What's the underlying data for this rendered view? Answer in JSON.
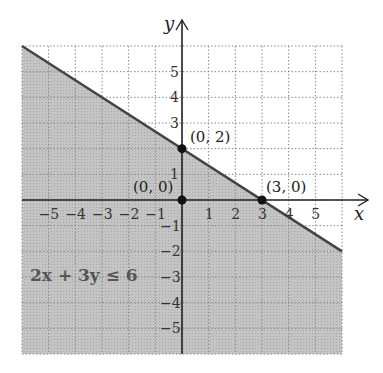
{
  "chart_data": {
    "type": "line",
    "title": "",
    "xlabel": "x",
    "ylabel": "y",
    "xlim": [
      -6,
      6
    ],
    "ylim": [
      -6,
      6
    ],
    "grid": true,
    "x_ticks": [
      -5,
      -4,
      -3,
      -2,
      -1,
      1,
      2,
      3,
      4,
      5
    ],
    "x_tick_labels": [
      "−5",
      "−4",
      "−3",
      "−2",
      "−1",
      "1",
      "2",
      "3",
      "4",
      "5"
    ],
    "y_ticks": [
      5,
      4,
      3,
      1,
      -1,
      -2,
      -3,
      -4,
      -5
    ],
    "y_tick_labels": [
      "5",
      "4",
      "3",
      "1",
      "−1",
      "−2",
      "−3",
      "−4",
      "−5"
    ],
    "boundary_line": {
      "equation": "2x + 3y = 6",
      "points": [
        [
          -6,
          6
        ],
        [
          6,
          -2
        ]
      ]
    },
    "shaded_region": {
      "inequality": "2x + 3y ≤ 6",
      "side": "below",
      "color": "#bdbdbd"
    },
    "points": [
      {
        "x": 0,
        "y": 2,
        "label": "(0, 2)"
      },
      {
        "x": 0,
        "y": 0,
        "label": "(0, 0)"
      },
      {
        "x": 3,
        "y": 0,
        "label": "(3, 0)"
      }
    ],
    "annotations": [
      {
        "text": "2x + 3y ≤ 6",
        "x": -5.7,
        "y": -2.9
      }
    ]
  },
  "labels": {
    "x_axis": "x",
    "y_axis": "y",
    "inequality_text": "2x + 3y ≤ 6",
    "point_02": "(0, 2)",
    "point_00": "(0, 0)",
    "point_30": "(3, 0)"
  }
}
